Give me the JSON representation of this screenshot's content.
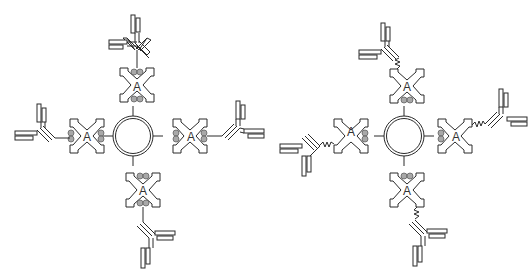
{
  "diagram": {
    "panels": [
      {
        "id": "left",
        "description": "Central bead with four protein A units; each protein A has binding beads on both sides, antibodies attached by straight linkers",
        "center": {
          "x": 133,
          "y": 136
        },
        "linker": "straight",
        "units": [
          {
            "direction": "up",
            "label": "A"
          },
          {
            "direction": "right",
            "label": "A"
          },
          {
            "direction": "down",
            "label": "A"
          },
          {
            "direction": "left",
            "label": "A"
          }
        ]
      },
      {
        "id": "right",
        "description": "Central bead with four protein A units; binding beads only on the inner side, antibodies attached by zig-zag (flexible) linkers",
        "center": {
          "x": 404,
          "y": 136
        },
        "linker": "zigzag",
        "units": [
          {
            "direction": "up",
            "label": "A"
          },
          {
            "direction": "right",
            "label": "A"
          },
          {
            "direction": "down",
            "label": "A"
          },
          {
            "direction": "left",
            "label": "A"
          }
        ]
      }
    ],
    "colors": {
      "stroke": "#2b2b2b",
      "bead": "#a8a8a8",
      "background": "#ffffff"
    }
  }
}
